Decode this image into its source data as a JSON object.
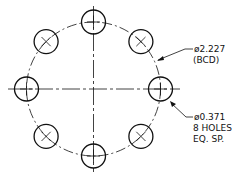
{
  "drawing": {
    "type": "bolt circle",
    "bcd": {
      "label": "ø2.227",
      "note": "(BCD)"
    },
    "holes": {
      "label": "ø0.371",
      "count_note": "8 HOLES",
      "spacing_note": "EQ. SP.",
      "count": 8
    },
    "line_color": "#111111"
  }
}
